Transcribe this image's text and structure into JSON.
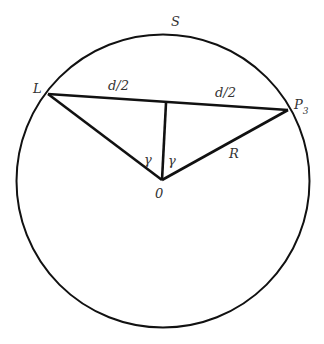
{
  "diagram": {
    "type": "geometry-circle-chord",
    "colors": {
      "stroke": "#111111",
      "label": "#333333",
      "background": "#ffffff"
    },
    "circle": {
      "label": "S",
      "cx": 163,
      "cy": 181,
      "r": 146
    },
    "points": {
      "L": {
        "label": "L",
        "x": 48,
        "y": 94
      },
      "P3": {
        "label": "P",
        "subscript": "3",
        "x": 288,
        "y": 110
      },
      "O": {
        "label": "0",
        "x": 162,
        "y": 180
      },
      "M": {
        "label": "",
        "x": 166,
        "y": 103
      }
    },
    "segments": [
      {
        "from": "L",
        "to": "P3",
        "name": "chord"
      },
      {
        "from": "L",
        "to": "O",
        "name": "radius-left"
      },
      {
        "from": "O",
        "to": "P3",
        "name": "radius-right",
        "label": "R"
      },
      {
        "from": "O",
        "to": "M",
        "name": "perpendicular"
      }
    ],
    "labels": {
      "circle": "S",
      "left_point": "L",
      "right_point_main": "P",
      "right_point_sub": "3",
      "center": "0",
      "half_chord_left": "d/2",
      "half_chord_right": "d/2",
      "angle_left": "γ",
      "angle_right": "γ",
      "radius": "R"
    }
  }
}
